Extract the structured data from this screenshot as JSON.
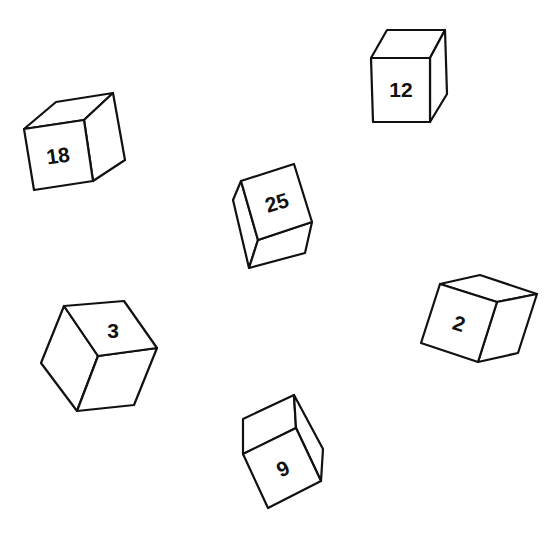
{
  "scene": {
    "description": "Six line-drawn cubes in various orientations, each labeled with a number",
    "background_color": "#ffffff",
    "stroke_color": "#111111"
  },
  "cubes": [
    {
      "label": "18",
      "position": "upper-left"
    },
    {
      "label": "12",
      "position": "upper-right"
    },
    {
      "label": "25",
      "position": "center"
    },
    {
      "label": "3",
      "position": "lower-left"
    },
    {
      "label": "2",
      "position": "right"
    },
    {
      "label": "9",
      "position": "bottom-center"
    }
  ]
}
